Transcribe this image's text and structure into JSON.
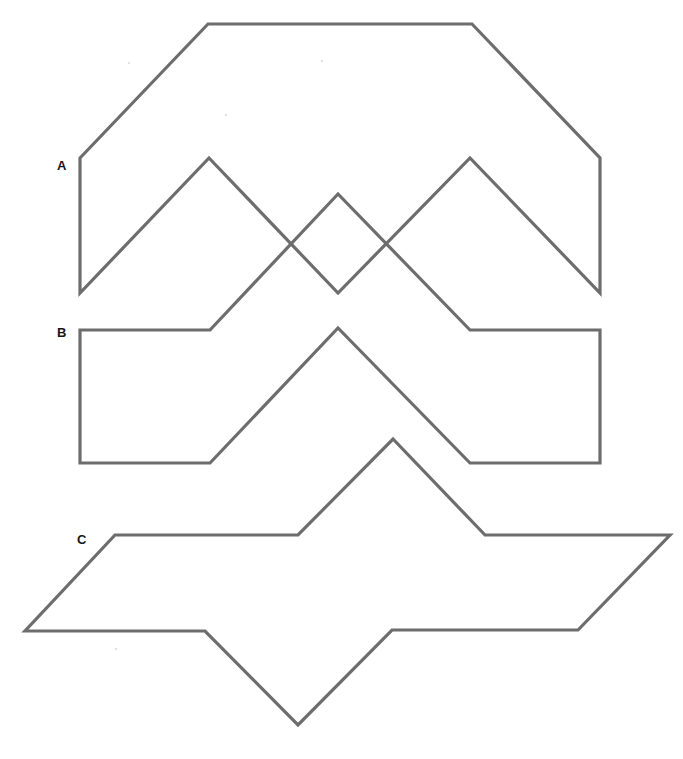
{
  "figure": {
    "width": 683,
    "height": 759,
    "background_color": "#ffffff",
    "stroke_color": "#6d6d6d",
    "stroke_width": 3.2,
    "labels": [
      {
        "id": "A",
        "text": "A",
        "x": 57,
        "y": 159
      },
      {
        "id": "B",
        "text": "B",
        "x": 57,
        "y": 326
      },
      {
        "id": "C",
        "text": "C",
        "x": 77,
        "y": 533
      }
    ],
    "shapes": [
      {
        "id": "A",
        "name": "shape-a-outline",
        "description": "Wide flat-topped hexagonal arch whose lower edge is a broad notched chevron",
        "closed": true,
        "points": [
          [
            80,
            158
          ],
          [
            208,
            24
          ],
          [
            472,
            24
          ],
          [
            600,
            158
          ],
          [
            600,
            293
          ],
          [
            470,
            158
          ],
          [
            338,
            293
          ],
          [
            209,
            158
          ],
          [
            80,
            293
          ]
        ]
      },
      {
        "id": "B",
        "name": "shape-b-outline",
        "description": "Rectangular band whose upper edge is a notched chevron matching shape A lower edge",
        "closed": true,
        "points": [
          [
            80,
            330
          ],
          [
            210,
            330
          ],
          [
            338,
            194
          ],
          [
            470,
            330
          ],
          [
            600,
            330
          ],
          [
            600,
            463
          ],
          [
            470,
            463
          ],
          [
            338,
            328
          ],
          [
            210,
            463
          ],
          [
            80,
            463
          ]
        ]
      },
      {
        "id": "C",
        "name": "shape-c-outline",
        "description": "Wide parallelogram with a peak notch in the top edge and a V notch in the bottom edge",
        "closed": true,
        "points": [
          [
            115,
            535
          ],
          [
            298,
            535
          ],
          [
            393,
            439
          ],
          [
            485,
            535
          ],
          [
            670,
            535
          ],
          [
            578,
            630
          ],
          [
            392,
            630
          ],
          [
            298,
            725
          ],
          [
            205,
            631
          ],
          [
            25,
            631
          ]
        ]
      }
    ],
    "specks": [
      {
        "x": 128,
        "y": 62
      },
      {
        "x": 321,
        "y": 60
      },
      {
        "x": 225,
        "y": 114
      },
      {
        "x": 115,
        "y": 648
      }
    ]
  }
}
